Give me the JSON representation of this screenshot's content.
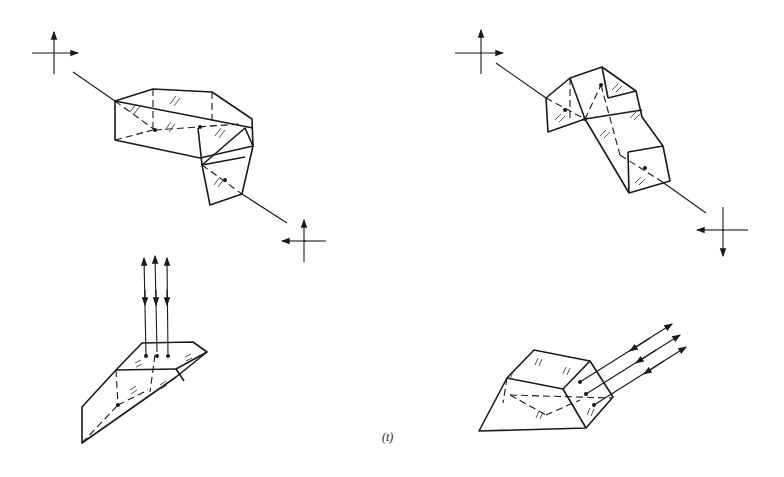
{
  "figure": {
    "caption": "(t)",
    "panels": [
      {
        "id": "top-left",
        "description": "Compound prism with input and output polarization crosses; image rotated, beam offset"
      },
      {
        "id": "top-right",
        "description": "Compound prism with input and output polarization crosses; image inverted"
      },
      {
        "id": "bottom-left",
        "description": "Retroreflecting roof prism with three vertical bidirectional rays"
      },
      {
        "id": "bottom-right",
        "description": "Retroreflecting prism with three oblique bidirectional rays"
      }
    ],
    "colors": {
      "ink": "#1a1a1a",
      "background": "#ffffff"
    }
  }
}
